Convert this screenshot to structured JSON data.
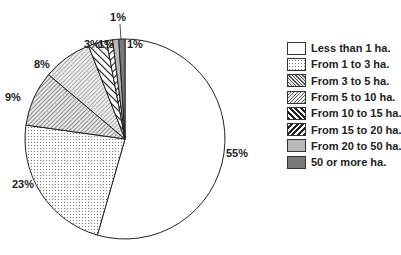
{
  "chart_data": {
    "type": "pie",
    "title": "",
    "start_angle": "12 o'clock, clockwise",
    "categories": [
      "Less than 1 ha.",
      "From 1 to 3 ha.",
      "From 3 to 5 ha.",
      "From 5 to 10 ha.",
      "From 10 to 15 ha.",
      "From 15 to 20 ha.",
      "From 20 to 50 ha.",
      "50 or more ha."
    ],
    "values": [
      55,
      23,
      9,
      8,
      3,
      1,
      1,
      1
    ],
    "labels": [
      "55%",
      "23%",
      "9%",
      "8%",
      "3%",
      "1%",
      "1%",
      "1%"
    ],
    "patterns": [
      "blank",
      "dots",
      "fine-diagonal-dense",
      "fine-diagonal-light",
      "backslash-hatch",
      "slash-hatch",
      "light-gray",
      "dark-gray"
    ],
    "legend_position": "right"
  },
  "legend": [
    {
      "label": "Less than 1 ha.",
      "pattern": "blank"
    },
    {
      "label": "From 1 to 3 ha.",
      "pattern": "dots"
    },
    {
      "label": "From 3 to 5 ha.",
      "pattern": "fine-diagonal-dense"
    },
    {
      "label": "From 5 to 10 ha.",
      "pattern": "fine-diagonal-light"
    },
    {
      "label": "From 10 to 15 ha.",
      "pattern": "backslash-hatch"
    },
    {
      "label": "From 15 to 20 ha.",
      "pattern": "slash-hatch"
    },
    {
      "label": "From 20 to 50 ha.",
      "pattern": "light-gray"
    },
    {
      "label": "50 or more ha.",
      "pattern": "dark-gray"
    }
  ]
}
